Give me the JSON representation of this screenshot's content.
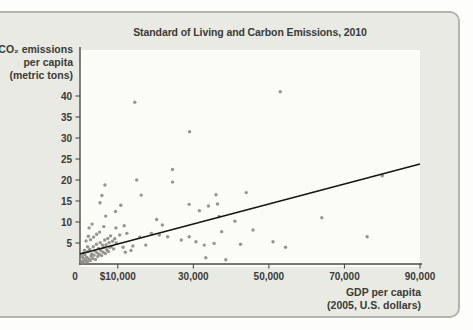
{
  "figure": {
    "title": "Standard of Living and Carbon Emissions, 2010"
  },
  "colors": {
    "card_bg": "#e9eae4",
    "card_border": "#b2b4ad",
    "plot_bg": "#fbfbf8",
    "axis": "#4a4a46",
    "tick_text": "#3a3a38",
    "dot": "#8d8d86",
    "trend_line": "#161614",
    "title_text": "#3a3a38"
  },
  "chart_data": {
    "type": "scatter",
    "title": "Standard of Living and Carbon Emissions, 2010",
    "legend": "none",
    "grid": false,
    "x_axis": {
      "title_lines": [
        "GDP per capita",
        "(2005, U.S. dollars)"
      ],
      "range": [
        0,
        90000
      ],
      "ticks": [
        {
          "value": 0,
          "label": "0"
        },
        {
          "value": 10000,
          "label": "$10,000"
        },
        {
          "value": 30000,
          "label": "30,000"
        },
        {
          "value": 50000,
          "label": "50,000"
        },
        {
          "value": 70000,
          "label": "70,000"
        },
        {
          "value": 90000,
          "label": "90,000"
        }
      ]
    },
    "y_axis": {
      "title_lines": [
        "CO₂ emissions",
        "per capita",
        "(metric tons)"
      ],
      "range": [
        0,
        51
      ],
      "ticks": [
        {
          "value": 5,
          "label": "5"
        },
        {
          "value": 10,
          "label": "10"
        },
        {
          "value": 15,
          "label": "15"
        },
        {
          "value": 20,
          "label": "20"
        },
        {
          "value": 25,
          "label": "25"
        },
        {
          "value": 30,
          "label": "30"
        },
        {
          "value": 35,
          "label": "35"
        },
        {
          "value": 40,
          "label": "40"
        }
      ]
    },
    "trendline": {
      "x1": 0,
      "y1": 2.4,
      "x2": 90000,
      "y2": 23.8
    },
    "points": [
      [
        53000,
        41
      ],
      [
        14500,
        38.5
      ],
      [
        29000,
        31.5
      ],
      [
        24500,
        22.5
      ],
      [
        80000,
        21
      ],
      [
        15000,
        20
      ],
      [
        24500,
        19.5
      ],
      [
        6600,
        18.8
      ],
      [
        44000,
        17
      ],
      [
        36000,
        16.5
      ],
      [
        16200,
        16.4
      ],
      [
        5800,
        16.3
      ],
      [
        5300,
        14.6
      ],
      [
        28900,
        14.2
      ],
      [
        36400,
        14.3
      ],
      [
        10800,
        14
      ],
      [
        34000,
        13.8
      ],
      [
        31600,
        12.7
      ],
      [
        9400,
        12.5
      ],
      [
        6800,
        11.4
      ],
      [
        36800,
        11.3
      ],
      [
        64000,
        11
      ],
      [
        20300,
        10.6
      ],
      [
        41000,
        10.2
      ],
      [
        3200,
        9.5
      ],
      [
        21800,
        9.3
      ],
      [
        11700,
        9.1
      ],
      [
        6300,
        8.9
      ],
      [
        45800,
        8.1
      ],
      [
        9500,
        8.6
      ],
      [
        2400,
        8.6
      ],
      [
        18900,
        7.3
      ],
      [
        12400,
        7.3
      ],
      [
        37500,
        7.7
      ],
      [
        76000,
        6.5
      ],
      [
        10500,
        6.9
      ],
      [
        21000,
        6.9
      ],
      [
        15800,
        6.4
      ],
      [
        23200,
        6.5
      ],
      [
        28900,
        6.5
      ],
      [
        26800,
        5.7
      ],
      [
        30700,
        5.3
      ],
      [
        51100,
        5.3
      ],
      [
        35500,
        4.9
      ],
      [
        42500,
        4.7
      ],
      [
        17400,
        4.5
      ],
      [
        32900,
        4.5
      ],
      [
        14000,
        4.3
      ],
      [
        54400,
        4
      ],
      [
        11400,
        4
      ],
      [
        33300,
        1.5
      ],
      [
        38600,
        1
      ],
      [
        12000,
        2.8
      ],
      [
        13500,
        3.2
      ],
      [
        350,
        0.4
      ],
      [
        650,
        0.6
      ],
      [
        900,
        1.3
      ],
      [
        1050,
        0.3
      ],
      [
        1300,
        2.2
      ],
      [
        1500,
        0.9
      ],
      [
        1750,
        1.6
      ],
      [
        1950,
        0.5
      ],
      [
        2100,
        2.9
      ],
      [
        2300,
        1.2
      ],
      [
        2550,
        3.5
      ],
      [
        2700,
        0.8
      ],
      [
        2900,
        1.9
      ],
      [
        3100,
        2.4
      ],
      [
        3300,
        1.3
      ],
      [
        3500,
        4.1
      ],
      [
        3700,
        2.1
      ],
      [
        3950,
        3.1
      ],
      [
        4100,
        1.1
      ],
      [
        4350,
        4.7
      ],
      [
        4500,
        2.7
      ],
      [
        4700,
        1.8
      ],
      [
        4900,
        3.7
      ],
      [
        5100,
        2.3
      ],
      [
        5350,
        5.1
      ],
      [
        5500,
        3.2
      ],
      [
        5700,
        2
      ],
      [
        5950,
        4.5
      ],
      [
        6100,
        2.8
      ],
      [
        6300,
        3.9
      ],
      [
        6550,
        5.7
      ],
      [
        6700,
        2.5
      ],
      [
        6900,
        4.6
      ],
      [
        7100,
        3.4
      ],
      [
        7350,
        6.1
      ],
      [
        7500,
        3
      ],
      [
        7700,
        5.1
      ],
      [
        7950,
        4
      ],
      [
        8100,
        6.7
      ],
      [
        8300,
        4.2
      ],
      [
        8600,
        5.4
      ],
      [
        8900,
        3.6
      ],
      [
        9200,
        6
      ],
      [
        9600,
        5
      ],
      [
        2000,
        4.1
      ],
      [
        1200,
        3.3
      ],
      [
        800,
        2.6
      ],
      [
        2800,
        5.8
      ],
      [
        3600,
        6.4
      ],
      [
        4400,
        7.1
      ],
      [
        1600,
        5.5
      ],
      [
        600,
        1.8
      ],
      [
        5200,
        7.6
      ],
      [
        2200,
        6.6
      ]
    ]
  }
}
